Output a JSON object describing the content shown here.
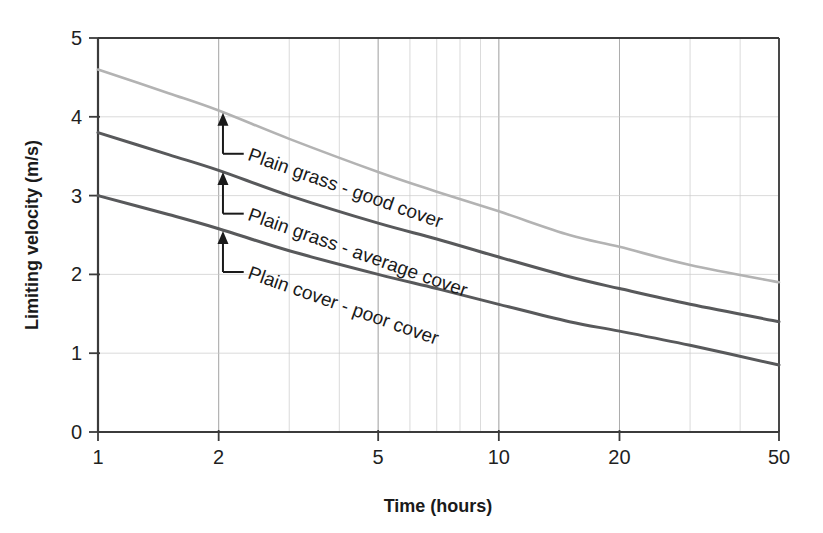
{
  "chart_data": {
    "type": "line",
    "title": "",
    "xlabel": "Time (hours)",
    "ylabel": "Limiting velocity (m/s)",
    "xscale": "log",
    "yscale": "linear",
    "xlim": [
      1,
      50
    ],
    "ylim": [
      0,
      5
    ],
    "xticks": [
      1,
      2,
      5,
      10,
      20,
      50
    ],
    "xticklabels": [
      "1",
      "2",
      "5",
      "10",
      "20",
      "50"
    ],
    "yticks": [
      0,
      1,
      2,
      3,
      4,
      5
    ],
    "yticklabels": [
      "0",
      "1",
      "2",
      "3",
      "4",
      "5"
    ],
    "grid": true,
    "grid_minor_log": true,
    "legend": "inline-annotations",
    "x": [
      1,
      1.5,
      2,
      3,
      5,
      7,
      10,
      15,
      20,
      30,
      50
    ],
    "series": [
      {
        "name": "Plain grass - good cover",
        "color": "#b3b3b3",
        "values": [
          4.6,
          4.3,
          4.08,
          3.72,
          3.3,
          3.05,
          2.8,
          2.5,
          2.35,
          2.12,
          1.9
        ]
      },
      {
        "name": "Plain grass - average cover",
        "color": "#58595b",
        "values": [
          3.8,
          3.52,
          3.32,
          3.0,
          2.65,
          2.45,
          2.22,
          1.97,
          1.82,
          1.62,
          1.4
        ]
      },
      {
        "name": "Plain cover - poor cover",
        "color": "#58595b",
        "values": [
          3.0,
          2.76,
          2.58,
          2.3,
          2.0,
          1.82,
          1.62,
          1.4,
          1.28,
          1.1,
          0.85
        ]
      }
    ],
    "annotations": [
      {
        "text": "Plain grass - good cover",
        "target_x": 2.05,
        "target_y": 4.05,
        "label_x": 2.35,
        "label_y": 3.48,
        "rotation": 19.5
      },
      {
        "text": "Plain grass - average cover",
        "target_x": 2.05,
        "target_y": 3.3,
        "label_x": 2.35,
        "label_y": 2.72,
        "rotation": 19.5
      },
      {
        "text": "Plain cover - poor cover",
        "target_x": 2.05,
        "target_y": 2.55,
        "label_x": 2.35,
        "label_y": 1.98,
        "rotation": 19.5
      }
    ]
  },
  "axis": {
    "y_title": "Limiting velocity (m/s)",
    "x_title": "Time (hours)"
  },
  "ticks": {
    "y": [
      "5",
      "4",
      "3",
      "2",
      "1",
      "0"
    ],
    "x": [
      "1",
      "2",
      "5",
      "10",
      "20",
      "50"
    ]
  },
  "colors": {
    "curve_light": "#b3b3b3",
    "curve_dark": "#58595b",
    "axis": "#3b3b3b",
    "grid": "#c9c9c9",
    "text": "#1a1a1a",
    "background": "#ffffff"
  }
}
